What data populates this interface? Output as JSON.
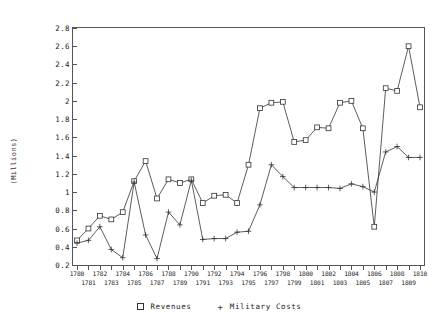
{
  "axis": {
    "y_title": "(Millions)",
    "y_ticks": [
      "2.8",
      "2.6",
      "2.4",
      "2.2",
      "2",
      "1.8",
      "1.6",
      "1.4",
      "1.2",
      "1",
      "0.8",
      "0.6",
      "0.4",
      "0.2"
    ]
  },
  "legend": {
    "items": [
      {
        "label": "Revenues",
        "marker": "square"
      },
      {
        "label": "Military Costs",
        "marker": "plus"
      }
    ]
  },
  "chart_data": {
    "type": "line",
    "title": "",
    "xlabel": "",
    "ylabel": "(Millions)",
    "ylim": [
      0.2,
      2.8
    ],
    "ytick_step": 0.2,
    "grid": false,
    "legend_position": "bottom",
    "marker_colors": {
      "revenues": "#333333",
      "military_costs": "#333333"
    },
    "categories": [
      "1780",
      "1781",
      "1782",
      "1783",
      "1784",
      "1785",
      "1786",
      "1787",
      "1788",
      "1789",
      "1790",
      "1791",
      "1792",
      "1793",
      "1794",
      "1795",
      "1796",
      "1797",
      "1798",
      "1799",
      "1800",
      "1801",
      "1802",
      "1803",
      "1804",
      "1805",
      "1806",
      "1807",
      "1808",
      "1809",
      "1810"
    ],
    "series": [
      {
        "name": "Revenues",
        "marker": "square",
        "values": [
          0.47,
          0.6,
          0.74,
          0.7,
          0.78,
          1.12,
          1.34,
          0.93,
          1.14,
          1.1,
          1.14,
          0.88,
          0.96,
          0.97,
          0.88,
          1.3,
          1.92,
          1.98,
          1.99,
          1.55,
          1.57,
          1.71,
          1.7,
          1.98,
          2.0,
          1.7,
          0.62,
          2.14,
          2.11,
          2.6,
          1.93
        ]
      },
      {
        "name": "Military Costs",
        "marker": "plus",
        "values": [
          0.44,
          0.47,
          0.62,
          0.37,
          0.28,
          1.11,
          0.53,
          0.27,
          0.78,
          0.64,
          1.13,
          0.48,
          0.49,
          0.49,
          0.56,
          0.57,
          0.86,
          1.3,
          1.17,
          1.05,
          1.05,
          1.05,
          1.05,
          1.04,
          1.09,
          1.06,
          1.0,
          1.44,
          1.5,
          1.38,
          1.38
        ]
      }
    ]
  }
}
